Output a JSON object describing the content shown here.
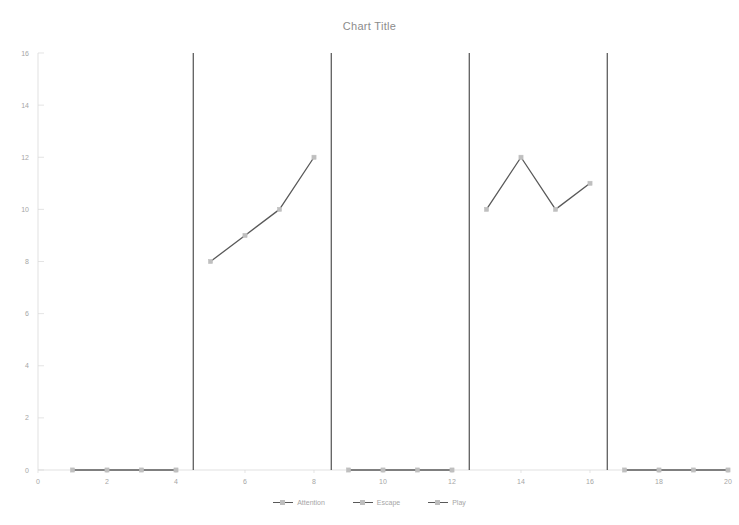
{
  "chart_data": {
    "type": "line",
    "title": "Chart Title",
    "xlabel": "",
    "ylabel": "",
    "xlim": [
      0,
      20
    ],
    "ylim": [
      0,
      16
    ],
    "x_ticks": [
      0,
      2,
      4,
      6,
      8,
      10,
      12,
      14,
      16,
      18,
      20
    ],
    "y_ticks": [
      0,
      2,
      4,
      6,
      8,
      10,
      12,
      14,
      16
    ],
    "grid": false,
    "legend_position": "bottom",
    "legend": [
      "Attention",
      "Escape",
      "Play"
    ],
    "series": [
      {
        "name": "Attention",
        "color": "#595959",
        "marker_color": "#bfbfbf",
        "x": [
          1,
          2,
          3,
          4
        ],
        "values": [
          0,
          0,
          0,
          0
        ]
      },
      {
        "name": "Escape",
        "color": "#595959",
        "marker_color": "#bfbfbf",
        "x": [
          5,
          6,
          7,
          8
        ],
        "values": [
          8,
          9,
          10,
          12
        ]
      },
      {
        "name": "Play",
        "color": "#595959",
        "marker_color": "#bfbfbf",
        "x": [
          9,
          10,
          11,
          12
        ],
        "values": [
          0,
          0,
          0,
          0
        ]
      },
      {
        "name": "Attention",
        "color": "#595959",
        "marker_color": "#bfbfbf",
        "x": [
          13,
          14,
          15,
          16
        ],
        "values": [
          10,
          12,
          10,
          11
        ]
      },
      {
        "name": "Escape",
        "color": "#595959",
        "marker_color": "#bfbfbf",
        "x": [
          17,
          18,
          19,
          20
        ],
        "values": [
          0,
          0,
          0,
          0
        ]
      }
    ],
    "phase_dividers": [
      4.5,
      8.5,
      12.5,
      16.5
    ],
    "divider_color": "#404040",
    "axis_color": "#d9d9d9",
    "tick_label_color": "#a6a6a6",
    "title_color": "#8c8c8c"
  },
  "legend_items": [
    {
      "label": "Attention"
    },
    {
      "label": "Escape"
    },
    {
      "label": "Play"
    }
  ]
}
